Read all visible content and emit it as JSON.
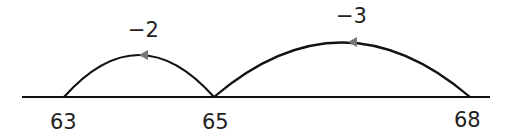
{
  "diagram": {
    "type": "number-line",
    "ticks": [
      {
        "value": "63",
        "x": 64
      },
      {
        "value": "65",
        "x": 214
      },
      {
        "value": "68",
        "x": 470
      }
    ],
    "jumps": [
      {
        "from": "65",
        "to": "63",
        "label": "−2"
      },
      {
        "from": "68",
        "to": "65",
        "label": "−3"
      }
    ],
    "colors": {
      "line": "#111111",
      "arrow": "#777777"
    }
  }
}
